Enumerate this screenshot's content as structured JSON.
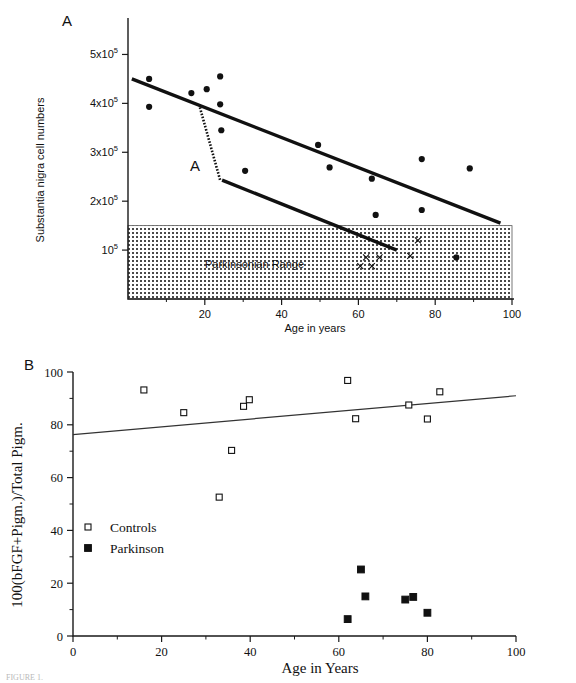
{
  "figure": {
    "caption_clipped": "FIGURE 1.",
    "panel_a_letter": "A",
    "panel_b_letter": "B"
  },
  "chart_data": [
    {
      "id": "panel_a",
      "type": "scatter",
      "title": "A",
      "xlabel": "Age in years",
      "ylabel": "Substantia nigra cell numbers",
      "xlim": [
        0,
        100
      ],
      "ylim": [
        0,
        550000
      ],
      "grid": false,
      "xticks": [
        0,
        20,
        40,
        60,
        80,
        100
      ],
      "xticklabels": [
        "",
        "20",
        "40",
        "60",
        "80",
        "100"
      ],
      "yticks": [
        100000,
        200000,
        300000,
        400000,
        500000
      ],
      "yticklabels": [
        "10",
        "2x10",
        "3x10",
        "4x10",
        "5x10"
      ],
      "ytick_exponent": "5",
      "shaded_band": {
        "label": "Parkinsonian Range",
        "y_from": 0,
        "y_to": 150000,
        "fill": "#d2d2d2"
      },
      "annotation": {
        "label": "A",
        "from": [
          18.5,
          398000
        ],
        "to": [
          24.0,
          243000
        ]
      },
      "series": [
        {
          "name": "control-cell-counts",
          "marker": "filled-circle",
          "points": [
            [
              5.5,
              450000
            ],
            [
              5.5,
              393000
            ],
            [
              16.5,
              421000
            ],
            [
              20.5,
              429000
            ],
            [
              24.0,
              455000
            ],
            [
              24.0,
              398000
            ],
            [
              24.3,
              345000
            ],
            [
              30.5,
              262000
            ],
            [
              49.5,
              315000
            ],
            [
              52.5,
              269000
            ],
            [
              63.5,
              246000
            ],
            [
              64.5,
              172000
            ],
            [
              76.5,
              286000
            ],
            [
              76.5,
              182000
            ],
            [
              89.0,
              267000
            ],
            [
              85.5,
              85000
            ]
          ]
        },
        {
          "name": "parkinson-cell-counts",
          "marker": "x",
          "points": [
            [
              75.5,
              120000
            ],
            [
              62.0,
              85000
            ],
            [
              65.5,
              85000
            ],
            [
              73.5,
              88000
            ],
            [
              60.5,
              67000
            ],
            [
              63.5,
              67000
            ]
          ]
        }
      ],
      "lines": [
        {
          "name": "upper-normal-aging-line",
          "from": [
            1.0,
            450000
          ],
          "to": [
            97.0,
            155000
          ]
        },
        {
          "name": "lower-accelerated-loss-line",
          "from": [
            24.5,
            243000
          ],
          "to": [
            70.0,
            100000
          ]
        }
      ]
    },
    {
      "id": "panel_b",
      "type": "scatter",
      "title": "B",
      "xlabel": "Age in Years",
      "ylabel": "100(bFGF+Pigm.)/Total Pigm.",
      "xlim": [
        0,
        100
      ],
      "ylim": [
        0,
        100
      ],
      "grid": false,
      "xticks": [
        0,
        20,
        40,
        60,
        80,
        100
      ],
      "xticklabels": [
        "0",
        "20",
        "40",
        "60",
        "80",
        "100"
      ],
      "yticks": [
        0,
        20,
        40,
        60,
        80,
        100
      ],
      "yticklabels": [
        "0",
        "20",
        "40",
        "60",
        "80",
        "100"
      ],
      "annotation_text": "(No significant correlation for controls, p = 0.42)",
      "regression_line": {
        "name": "controls-regression",
        "from": [
          0,
          76.3
        ],
        "to": [
          100,
          91.0
        ]
      },
      "series": [
        {
          "name": "Controls",
          "marker": "open-square",
          "points": [
            [
              16.0,
              93.2
            ],
            [
              25.0,
              84.6
            ],
            [
              38.5,
              87.0
            ],
            [
              39.8,
              89.5
            ],
            [
              33.0,
              52.6
            ],
            [
              35.8,
              70.3
            ],
            [
              62.0,
              96.8
            ],
            [
              63.8,
              82.3
            ],
            [
              75.8,
              87.5
            ],
            [
              80.0,
              82.2
            ],
            [
              82.8,
              92.5
            ]
          ]
        },
        {
          "name": "Parkinson",
          "marker": "filled-square",
          "points": [
            [
              62.0,
              6.4
            ],
            [
              65.0,
              25.2
            ],
            [
              66.0,
              15.0
            ],
            [
              75.0,
              13.8
            ],
            [
              76.8,
              14.8
            ],
            [
              80.0,
              8.8
            ]
          ]
        }
      ],
      "legend": {
        "position": "lower-left",
        "entries": [
          {
            "label": "Controls",
            "marker": "open-square"
          },
          {
            "label": "Parkinson",
            "marker": "filled-square"
          }
        ]
      }
    }
  ]
}
